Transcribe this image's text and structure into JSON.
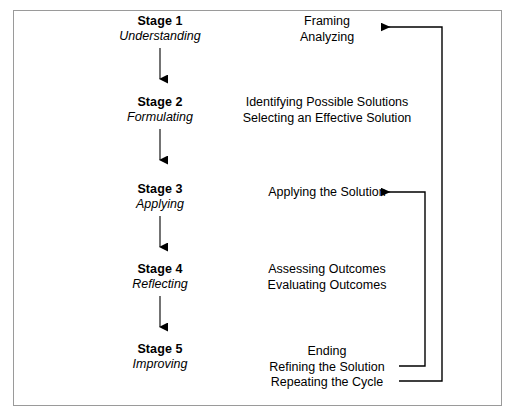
{
  "diagram": {
    "stages": [
      {
        "title": "Stage 1",
        "subtitle": "Understanding"
      },
      {
        "title": "Stage 2",
        "subtitle": "Formulating"
      },
      {
        "title": "Stage 3",
        "subtitle": "Applying"
      },
      {
        "title": "Stage 4",
        "subtitle": "Reflecting"
      },
      {
        "title": "Stage 5",
        "subtitle": "Improving"
      }
    ],
    "activities": [
      {
        "lines": [
          "Framing",
          "Analyzing"
        ]
      },
      {
        "lines": [
          "Identifying Possible Solutions",
          "Selecting an Effective Solution"
        ]
      },
      {
        "lines": [
          "Applying the Solution"
        ]
      },
      {
        "lines": [
          "Assessing Outcomes",
          "Evaluating Outcomes"
        ]
      },
      {
        "lines": [
          "Ending",
          "Refining the Solution",
          "Repeating the Cycle"
        ]
      }
    ],
    "feedback_loops": [
      {
        "name": "refining-loop",
        "from": "Refining the Solution",
        "to": "Applying the Solution"
      },
      {
        "name": "repeating-loop",
        "from": "Repeating the Cycle",
        "to": "Framing"
      }
    ],
    "colors": {
      "ink": "#000000",
      "frame": "#9a9a9a",
      "background": "#ffffff"
    }
  }
}
